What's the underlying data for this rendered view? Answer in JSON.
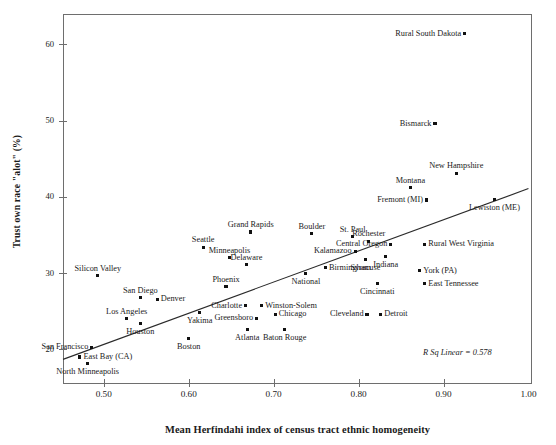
{
  "chart_data": {
    "type": "scatter",
    "title": "",
    "xlabel": "Mean Herfindahi index of census tract ethnic homogeneity",
    "ylabel": "Trust own race \"alot\" (%)",
    "xlim": [
      0.452,
      1.003
    ],
    "ylim": [
      15.6,
      64.0
    ],
    "xticks": [
      0.5,
      0.6,
      0.7,
      0.8,
      0.9,
      1.0
    ],
    "xticklabels": [
      "0.50",
      "0.60",
      "0.70",
      "0.80",
      "0.90",
      "1.00"
    ],
    "yticks": [
      20,
      30,
      40,
      50,
      60
    ],
    "yticklabels": [
      "20",
      "30",
      "40",
      "50",
      "60"
    ],
    "grid": false,
    "legend": false,
    "annotation": "R Sq Linear = 0.578",
    "r_squared": 0.578,
    "fit_line": {
      "x0": 0.452,
      "y0": 18.7,
      "x1": 1.0,
      "y1": 41.1
    },
    "points": [
      {
        "label": "Rural South Dakota",
        "x": 0.925,
        "y": 61.4,
        "pos": "left"
      },
      {
        "label": "Bismarck",
        "x": 0.89,
        "y": 49.6,
        "pos": "left"
      },
      {
        "label": "New Hampshire",
        "x": 0.915,
        "y": 43.1,
        "pos": "above"
      },
      {
        "label": "Montana",
        "x": 0.861,
        "y": 41.2,
        "pos": "above"
      },
      {
        "label": "Fremont (MI)",
        "x": 0.88,
        "y": 39.6,
        "pos": "left"
      },
      {
        "label": "Lewiston (ME)",
        "x": 0.96,
        "y": 39.7,
        "pos": "below"
      },
      {
        "label": "Grand Rapids",
        "x": 0.673,
        "y": 35.4,
        "pos": "above"
      },
      {
        "label": "Boulder",
        "x": 0.745,
        "y": 35.2,
        "pos": "above"
      },
      {
        "label": "St. Paul",
        "x": 0.793,
        "y": 34.8,
        "pos": "above"
      },
      {
        "label": "Rochester",
        "x": 0.812,
        "y": 34.2,
        "pos": "above"
      },
      {
        "label": "Central Oregon",
        "x": 0.838,
        "y": 33.8,
        "pos": "left"
      },
      {
        "label": "Rural West Virginia",
        "x": 0.878,
        "y": 33.8,
        "pos": "right"
      },
      {
        "label": "Seattle",
        "x": 0.617,
        "y": 33.4,
        "pos": "above"
      },
      {
        "label": "Kalamazoo",
        "x": 0.796,
        "y": 32.9,
        "pos": "left"
      },
      {
        "label": "Minneapolis",
        "x": 0.648,
        "y": 32.0,
        "pos": "above"
      },
      {
        "label": "Syracuse",
        "x": 0.808,
        "y": 31.8,
        "pos": "below"
      },
      {
        "label": "Indiana",
        "x": 0.832,
        "y": 32.2,
        "pos": "below"
      },
      {
        "label": "Delaware",
        "x": 0.668,
        "y": 31.1,
        "pos": "above"
      },
      {
        "label": "Birmingham",
        "x": 0.761,
        "y": 30.7,
        "pos": "right"
      },
      {
        "label": "York (PA)",
        "x": 0.872,
        "y": 30.3,
        "pos": "right"
      },
      {
        "label": "Silicon Valley",
        "x": 0.493,
        "y": 29.7,
        "pos": "above"
      },
      {
        "label": "National",
        "x": 0.738,
        "y": 30.0,
        "pos": "below"
      },
      {
        "label": "East Tennessee",
        "x": 0.878,
        "y": 28.6,
        "pos": "right"
      },
      {
        "label": "Cincinnati",
        "x": 0.822,
        "y": 28.6,
        "pos": "below"
      },
      {
        "label": "Phoenix",
        "x": 0.644,
        "y": 28.2,
        "pos": "above"
      },
      {
        "label": "San Diego",
        "x": 0.543,
        "y": 26.8,
        "pos": "above"
      },
      {
        "label": "Denver",
        "x": 0.563,
        "y": 26.6,
        "pos": "right"
      },
      {
        "label": "Charlotte",
        "x": 0.667,
        "y": 25.7,
        "pos": "left"
      },
      {
        "label": "Winston-Solem",
        "x": 0.686,
        "y": 25.7,
        "pos": "right"
      },
      {
        "label": "Cleveland",
        "x": 0.81,
        "y": 24.6,
        "pos": "left"
      },
      {
        "label": "Detroit",
        "x": 0.826,
        "y": 24.6,
        "pos": "right"
      },
      {
        "label": "Yakima",
        "x": 0.613,
        "y": 24.8,
        "pos": "below"
      },
      {
        "label": "Chicago",
        "x": 0.702,
        "y": 24.6,
        "pos": "right"
      },
      {
        "label": "Los Angeles",
        "x": 0.527,
        "y": 24.0,
        "pos": "above"
      },
      {
        "label": "Greensboro",
        "x": 0.68,
        "y": 24.1,
        "pos": "left"
      },
      {
        "label": "Houston",
        "x": 0.543,
        "y": 23.4,
        "pos": "below"
      },
      {
        "label": "Atlanta",
        "x": 0.669,
        "y": 22.6,
        "pos": "below"
      },
      {
        "label": "Baton Rouge",
        "x": 0.713,
        "y": 22.6,
        "pos": "below"
      },
      {
        "label": "Boston",
        "x": 0.6,
        "y": 21.4,
        "pos": "below"
      },
      {
        "label": "San Francisco",
        "x": 0.486,
        "y": 20.3,
        "pos": "left"
      },
      {
        "label": "East Bay (CA)",
        "x": 0.472,
        "y": 19.0,
        "pos": "right"
      },
      {
        "label": "North Minneapolis",
        "x": 0.481,
        "y": 18.2,
        "pos": "below"
      }
    ]
  }
}
